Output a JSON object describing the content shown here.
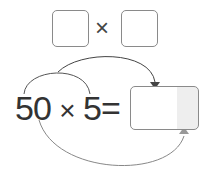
{
  "top": {
    "left_box": "",
    "operator": "×",
    "right_box": ""
  },
  "expression": {
    "a": "50",
    "op": "×",
    "b": "5",
    "eq": "=",
    "answer": ""
  },
  "colors": {
    "box_border": "#8a8a8a",
    "arrow_dark": "#444444",
    "arrow_light": "#999999",
    "answer_shade": "#eeeeee"
  }
}
